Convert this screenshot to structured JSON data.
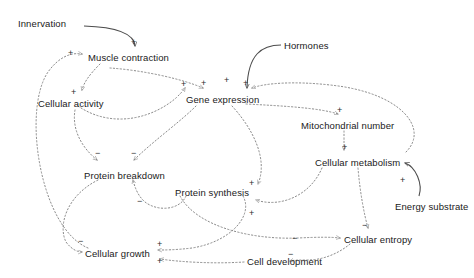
{
  "diagram": {
    "type": "causal-loop-diagram",
    "title": "",
    "background_color": "#ffffff",
    "link_color": "#7a7a7a",
    "solid_link_color": "#4d4d4d",
    "text_color": "#1a1a1a",
    "nodes": [
      {
        "id": "innervation",
        "label": "Innervation",
        "x": 18,
        "y": 18,
        "kind": "external-input"
      },
      {
        "id": "muscle-contraction",
        "label": "Muscle contraction",
        "x": 88,
        "y": 52,
        "kind": "variable"
      },
      {
        "id": "hormones",
        "label": "Hormones",
        "x": 284,
        "y": 40,
        "kind": "external-input"
      },
      {
        "id": "cellular-activity",
        "label": "Cellular activity",
        "x": 38,
        "y": 98,
        "kind": "variable"
      },
      {
        "id": "gene-expression",
        "label": "Gene expression",
        "x": 186,
        "y": 94,
        "kind": "variable"
      },
      {
        "id": "mitochondrial-number",
        "label": "Mitochondrial number",
        "x": 301,
        "y": 120,
        "kind": "variable"
      },
      {
        "id": "cellular-metabolism",
        "label": "Cellular metabolism",
        "x": 315,
        "y": 157,
        "kind": "variable"
      },
      {
        "id": "protein-breakdown",
        "label": "Protein breakdown",
        "x": 84,
        "y": 170,
        "kind": "variable"
      },
      {
        "id": "protein-synthesis",
        "label": "Protein synthesis",
        "x": 175,
        "y": 187,
        "kind": "variable"
      },
      {
        "id": "energy-substrate",
        "label": "Energy substrate",
        "x": 395,
        "y": 201,
        "kind": "external-input"
      },
      {
        "id": "cellular-entropy",
        "label": "Cellular entropy",
        "x": 344,
        "y": 234,
        "kind": "variable"
      },
      {
        "id": "cell-development",
        "label": "Cell development",
        "x": 247,
        "y": 256,
        "kind": "variable"
      },
      {
        "id": "cellular-growth",
        "label": "Cellular growth",
        "x": 85,
        "y": 248,
        "kind": "variable"
      }
    ],
    "signs": [
      {
        "id": "s1",
        "text": "+",
        "x": 131,
        "y": 38,
        "for": "innervation-to-muscle-contraction"
      },
      {
        "id": "s2",
        "text": "+",
        "x": 68,
        "y": 49,
        "for": "cellular-growth-to-muscle-contraction"
      },
      {
        "id": "s3",
        "text": "+",
        "x": 71,
        "y": 88,
        "for": "muscle-contraction-to-cellular-activity"
      },
      {
        "id": "s4",
        "text": "+",
        "x": 181,
        "y": 80,
        "for": "cellular-activity-to-gene-expression"
      },
      {
        "id": "s5",
        "text": "+",
        "x": 201,
        "y": 79,
        "for": "muscle-contraction-to-gene-expression"
      },
      {
        "id": "s6",
        "text": "+",
        "x": 224,
        "y": 76,
        "for": "hormones-to-gene-expression"
      },
      {
        "id": "s7",
        "text": "+",
        "x": 243,
        "y": 79,
        "for": "cellular-metabolism-to-gene-expression"
      },
      {
        "id": "s8",
        "text": "+",
        "x": 337,
        "y": 106,
        "for": "gene-expression-to-mitochondrial-number"
      },
      {
        "id": "s9",
        "text": "+",
        "x": 342,
        "y": 143,
        "for": "mitochondrial-number-to-cellular-metabolism"
      },
      {
        "id": "s10",
        "text": "+",
        "x": 400,
        "y": 176,
        "for": "energy-substrate-to-cellular-metabolism"
      },
      {
        "id": "s11",
        "text": "−",
        "x": 95,
        "y": 149,
        "for": "cellular-activity-to-protein-breakdown"
      },
      {
        "id": "s12",
        "text": "−",
        "x": 131,
        "y": 149,
        "for": "gene-expression-to-protein-breakdown"
      },
      {
        "id": "s13",
        "text": "−",
        "x": 137,
        "y": 197,
        "for": "protein-synthesis-to-protein-breakdown"
      },
      {
        "id": "s14",
        "text": "+",
        "x": 249,
        "y": 179,
        "for": "gene-expression-to-protein-synthesis"
      },
      {
        "id": "s15",
        "text": "+",
        "x": 249,
        "y": 209,
        "for": "cellular-metabolism-to-protein-synthesis"
      },
      {
        "id": "s16",
        "text": "−",
        "x": 362,
        "y": 221,
        "for": "cellular-metabolism-to-cellular-entropy"
      },
      {
        "id": "s17",
        "text": "−",
        "x": 292,
        "y": 234,
        "for": "cell-development-to-cellular-entropy"
      },
      {
        "id": "s18",
        "text": "−",
        "x": 288,
        "y": 250,
        "for": "cellular-entropy-to-cell-development"
      },
      {
        "id": "s19",
        "text": "−",
        "x": 78,
        "y": 237,
        "for": "protein-breakdown-to-cellular-growth"
      },
      {
        "id": "s20",
        "text": "+",
        "x": 157,
        "y": 240,
        "for": "protein-synthesis-to-cellular-growth"
      },
      {
        "id": "s21",
        "text": "+",
        "x": 157,
        "y": 257,
        "for": "cell-development-to-cellular-growth"
      }
    ],
    "links": [
      {
        "from": "innervation",
        "to": "muscle-contraction",
        "polarity": "+",
        "style": "solid"
      },
      {
        "from": "hormones",
        "to": "gene-expression",
        "polarity": "+",
        "style": "solid"
      },
      {
        "from": "energy-substrate",
        "to": "cellular-metabolism",
        "polarity": "+",
        "style": "solid"
      },
      {
        "from": "cellular-growth",
        "to": "muscle-contraction",
        "polarity": "+",
        "style": "dotted"
      },
      {
        "from": "muscle-contraction",
        "to": "cellular-activity",
        "polarity": "+",
        "style": "dotted"
      },
      {
        "from": "cellular-activity",
        "to": "gene-expression",
        "polarity": "+",
        "style": "dotted"
      },
      {
        "from": "muscle-contraction",
        "to": "gene-expression",
        "polarity": "+",
        "style": "dotted"
      },
      {
        "from": "cellular-metabolism",
        "to": "gene-expression",
        "polarity": "+",
        "style": "dotted"
      },
      {
        "from": "gene-expression",
        "to": "mitochondrial-number",
        "polarity": "+",
        "style": "dotted"
      },
      {
        "from": "mitochondrial-number",
        "to": "cellular-metabolism",
        "polarity": "+",
        "style": "dotted"
      },
      {
        "from": "cellular-activity",
        "to": "protein-breakdown",
        "polarity": "−",
        "style": "dotted"
      },
      {
        "from": "gene-expression",
        "to": "protein-breakdown",
        "polarity": "−",
        "style": "dotted"
      },
      {
        "from": "protein-synthesis",
        "to": "protein-breakdown",
        "polarity": "−",
        "style": "dotted"
      },
      {
        "from": "gene-expression",
        "to": "protein-synthesis",
        "polarity": "+",
        "style": "dotted"
      },
      {
        "from": "cellular-metabolism",
        "to": "protein-synthesis",
        "polarity": "+",
        "style": "dotted"
      },
      {
        "from": "cellular-metabolism",
        "to": "cellular-entropy",
        "polarity": "−",
        "style": "dotted"
      },
      {
        "from": "cell-development",
        "to": "cellular-entropy",
        "polarity": "−",
        "style": "dotted"
      },
      {
        "from": "cellular-entropy",
        "to": "cell-development",
        "polarity": "−",
        "style": "dotted"
      },
      {
        "from": "protein-breakdown",
        "to": "cellular-growth",
        "polarity": "−",
        "style": "dotted"
      },
      {
        "from": "protein-synthesis",
        "to": "cellular-growth",
        "polarity": "+",
        "style": "dotted"
      },
      {
        "from": "cell-development",
        "to": "cellular-growth",
        "polarity": "+",
        "style": "dotted"
      }
    ]
  }
}
